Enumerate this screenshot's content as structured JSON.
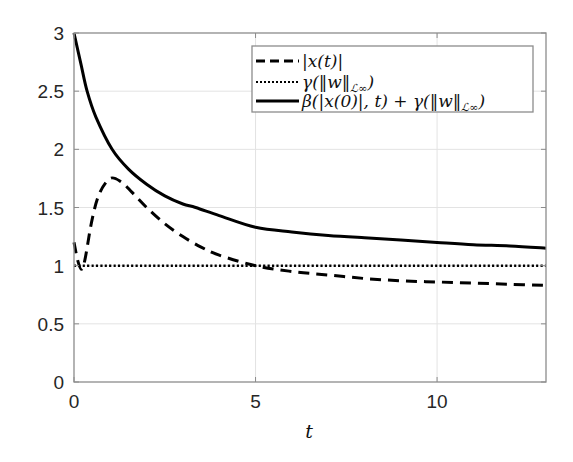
{
  "chart_data": {
    "type": "line",
    "title": "",
    "xlabel": "t",
    "ylabel": "",
    "xlim": [
      0,
      13
    ],
    "ylim": [
      0,
      3
    ],
    "xticks": [
      0,
      5,
      10
    ],
    "xtick_labels": [
      "0",
      "5",
      "10"
    ],
    "yticks": [
      0,
      0.5,
      1,
      1.5,
      2,
      2.5,
      3
    ],
    "ytick_labels": [
      "0",
      "0.5",
      "1",
      "1.5",
      "2",
      "2.5",
      "3"
    ],
    "grid": true,
    "legend_position": "upper right",
    "series": [
      {
        "name": "|x(t)|",
        "style": "dashed",
        "color": "#000000",
        "x": [
          0,
          0.1,
          0.2,
          0.3,
          0.5,
          0.7,
          1.0,
          1.3,
          1.6,
          2.0,
          2.5,
          3.0,
          3.5,
          4.0,
          5.0,
          6.0,
          7.0,
          8.0,
          9.0,
          10.0,
          11.0,
          12.0,
          13.0
        ],
        "y": [
          1.2,
          1.05,
          0.97,
          1.05,
          1.4,
          1.62,
          1.75,
          1.72,
          1.63,
          1.5,
          1.36,
          1.25,
          1.16,
          1.09,
          1.0,
          0.95,
          0.92,
          0.89,
          0.87,
          0.86,
          0.85,
          0.84,
          0.83
        ]
      },
      {
        "name": "γ(‖w‖_L∞)",
        "style": "dotted",
        "color": "#000000",
        "x": [
          0,
          13
        ],
        "y": [
          1.0,
          1.0
        ]
      },
      {
        "name": "β(|x(0)|, t) + γ(‖w‖_L∞)",
        "style": "solid",
        "color": "#000000",
        "x": [
          0,
          0.2,
          0.36,
          0.6,
          1.05,
          1.5,
          2.0,
          2.5,
          3.0,
          3.35,
          4.0,
          5.0,
          6.0,
          7.0,
          8.0,
          9.0,
          10.0,
          11.0,
          12.0,
          13.0
        ],
        "y": [
          3.0,
          2.72,
          2.5,
          2.28,
          2.0,
          1.83,
          1.7,
          1.6,
          1.53,
          1.5,
          1.43,
          1.33,
          1.29,
          1.26,
          1.24,
          1.22,
          1.2,
          1.18,
          1.17,
          1.15
        ]
      }
    ]
  },
  "legend": {
    "entries": [
      {
        "label": "|x(t)|",
        "style": "dashed"
      },
      {
        "label": "γ(‖w‖",
        "sub": "ℒ∞",
        "tail": ")",
        "style": "dotted"
      },
      {
        "label": "β(|x(0)|, t) + γ(‖w‖",
        "sub": "ℒ∞",
        "tail": ")",
        "style": "solid"
      }
    ]
  },
  "axes": {
    "xlabel": "t"
  }
}
